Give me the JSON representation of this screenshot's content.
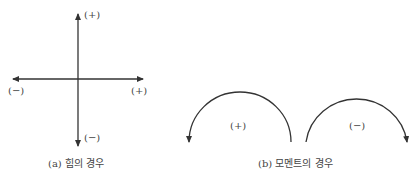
{
  "panel_a": {
    "caption": "(a) 힘의 경우",
    "labels": {
      "up": "(+)",
      "down": "(−)",
      "left": "(−)",
      "right": "(+)"
    }
  },
  "panel_b": {
    "caption": "(b) 모멘트의 경우",
    "arcs": [
      {
        "label": "(+)",
        "direction": "counterclockwise"
      },
      {
        "label": "(−)",
        "direction": "clockwise"
      }
    ]
  },
  "colors": {
    "stroke": "#333333",
    "text": "#444444"
  }
}
